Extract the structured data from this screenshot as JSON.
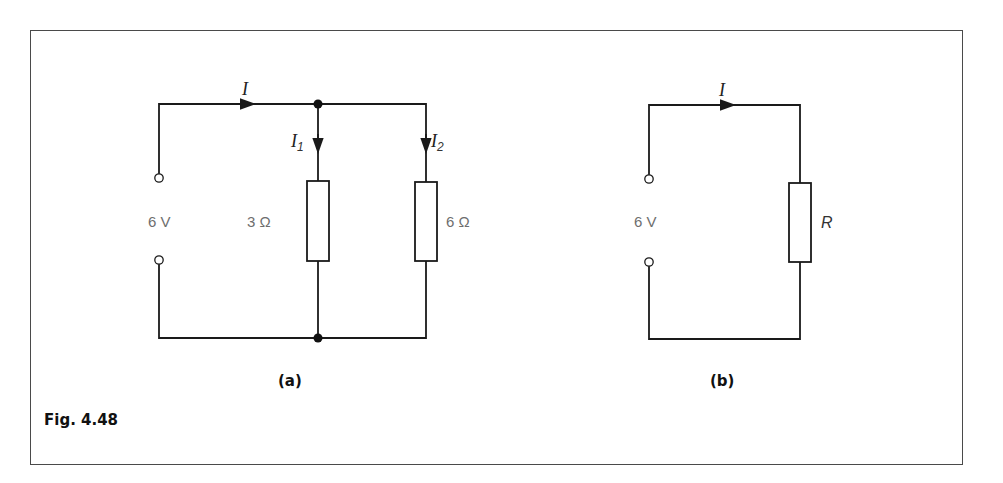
{
  "figure": {
    "caption": "Fig. 4.48"
  },
  "circuit_a": {
    "part_label": "(a)",
    "source_label": "6 V",
    "total_current": "I",
    "branch1": {
      "current": "I",
      "current_sub": "1",
      "resistance": "3 Ω"
    },
    "branch2": {
      "current": "I",
      "current_sub": "2",
      "resistance": "6 Ω"
    }
  },
  "circuit_b": {
    "part_label": "(b)",
    "source_label": "6 V",
    "current": "I",
    "resistance": "R"
  },
  "colors": {
    "wire": "#1a1a1a",
    "frame": "#4a4a4a",
    "value_text": "#6e6e6e"
  }
}
